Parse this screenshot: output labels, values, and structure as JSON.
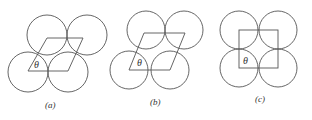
{
  "figure": {
    "panels": [
      {
        "id": "a",
        "caption": "(a)",
        "angle_label": "θ",
        "shape": "parallelogram (steep)"
      },
      {
        "id": "b",
        "caption": "(b)",
        "angle_label": "θ",
        "shape": "parallelogram"
      },
      {
        "id": "c",
        "caption": "(c)",
        "angle_label": "θ",
        "shape": "square"
      }
    ],
    "colors": {
      "stroke": "#555555",
      "background": "#ffffff"
    }
  }
}
